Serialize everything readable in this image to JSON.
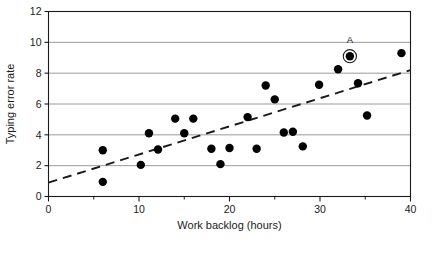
{
  "chart_data": {
    "type": "scatter",
    "title": "",
    "xlabel": "Work backlog (hours)",
    "ylabel": "Typing error rate",
    "xlim": [
      0,
      40
    ],
    "ylim": [
      0,
      12
    ],
    "xticks": [
      0,
      10,
      20,
      30,
      40
    ],
    "yticks": [
      0,
      2,
      4,
      6,
      8,
      10,
      12
    ],
    "xtick_labels": [
      "0",
      "10",
      "20",
      "30",
      "40"
    ],
    "ytick_labels": [
      "0",
      "2",
      "4",
      "6",
      "8",
      "10",
      "12"
    ],
    "x_minor_ticks": [
      5,
      15,
      25,
      35
    ],
    "grid": "horizontal",
    "grid_color": "#808080",
    "legend": "none",
    "marker_color": "#000000",
    "marker_size": 4.2,
    "points": [
      {
        "x": 6.0,
        "y": 3.0
      },
      {
        "x": 6.0,
        "y": 0.95
      },
      {
        "x": 10.2,
        "y": 2.05
      },
      {
        "x": 11.1,
        "y": 4.1
      },
      {
        "x": 12.1,
        "y": 3.05
      },
      {
        "x": 14.0,
        "y": 5.05
      },
      {
        "x": 15.0,
        "y": 4.1
      },
      {
        "x": 16.0,
        "y": 5.05
      },
      {
        "x": 18.0,
        "y": 3.1
      },
      {
        "x": 19.0,
        "y": 2.1
      },
      {
        "x": 20.0,
        "y": 3.15
      },
      {
        "x": 22.0,
        "y": 5.15
      },
      {
        "x": 23.0,
        "y": 3.1
      },
      {
        "x": 24.0,
        "y": 7.2
      },
      {
        "x": 25.0,
        "y": 6.3
      },
      {
        "x": 26.0,
        "y": 4.15
      },
      {
        "x": 27.0,
        "y": 4.2
      },
      {
        "x": 28.1,
        "y": 3.25
      },
      {
        "x": 29.9,
        "y": 7.25
      },
      {
        "x": 32.0,
        "y": 8.25
      },
      {
        "x": 33.3,
        "y": 9.1,
        "label": "A",
        "highlighted": true
      },
      {
        "x": 34.2,
        "y": 7.35
      },
      {
        "x": 35.2,
        "y": 5.25
      },
      {
        "x": 39.0,
        "y": 9.3
      }
    ],
    "trend_line": {
      "style": "dashed",
      "color": "#1a1a1a",
      "x0": 0.0,
      "y0": 0.9,
      "x1": 40.0,
      "y1": 8.2
    },
    "annotations": [
      {
        "text": "A",
        "x": 33.3,
        "y": 9.95,
        "for_point": 20
      }
    ]
  }
}
